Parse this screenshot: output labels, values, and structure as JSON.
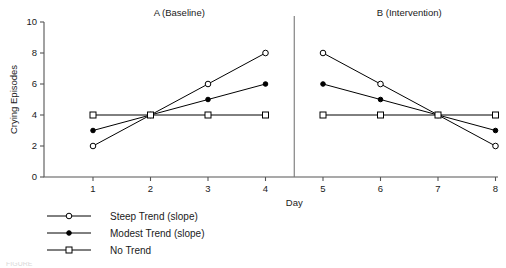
{
  "chart_data": {
    "type": "line",
    "title": "",
    "xlabel": "Day",
    "ylabel": "Crying Episodes",
    "x": [
      1,
      2,
      3,
      4,
      5,
      6,
      7,
      8
    ],
    "xlim": [
      0.5,
      8.35
    ],
    "ylim": [
      0,
      10
    ],
    "xticks": [
      "1",
      "2",
      "3",
      "4",
      "5",
      "6",
      "7",
      "8"
    ],
    "yticks": [
      "0",
      "2",
      "4",
      "6",
      "8",
      "10"
    ],
    "ytick_values": [
      0,
      2,
      4,
      6,
      8,
      10
    ],
    "grid": false,
    "legend_position": "below-left",
    "panels": [
      {
        "label": "A (Baseline)",
        "days": [
          1,
          2,
          3,
          4
        ]
      },
      {
        "label": "B (Intervention)",
        "days": [
          5,
          6,
          7,
          8
        ]
      }
    ],
    "phase_divider_x": 4.5,
    "series": [
      {
        "name": "Steep Trend (slope)",
        "marker": "open-circle",
        "values": [
          2,
          4,
          6,
          8,
          8,
          6,
          4,
          2
        ]
      },
      {
        "name": "Modest Trend (slope)",
        "marker": "filled-circle",
        "values": [
          3,
          4,
          5,
          6,
          6,
          5,
          4,
          3
        ]
      },
      {
        "name": "No Trend",
        "marker": "open-square",
        "values": [
          4,
          4,
          4,
          4,
          4,
          4,
          4,
          4
        ]
      }
    ]
  },
  "legend": {
    "entries": [
      {
        "label": "Steep Trend (slope)",
        "marker": "open-circle"
      },
      {
        "label": "Modest Trend (slope)",
        "marker": "filled-circle"
      },
      {
        "label": "No Trend",
        "marker": "open-square"
      }
    ]
  },
  "caption": {
    "cropped_text": "FIGURE"
  },
  "colors": {
    "ink": "#000000",
    "axis": "#555555",
    "divider": "#777777",
    "background": "#ffffff"
  }
}
